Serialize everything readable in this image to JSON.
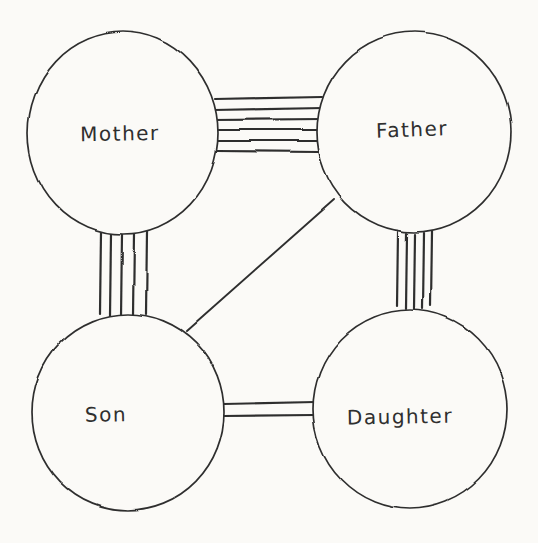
{
  "canvas": {
    "width": 538,
    "height": 543,
    "paper_color": "#fbfaf7",
    "ink_color": "#2f2f2f"
  },
  "diagram": {
    "nodes": [
      {
        "id": "mother",
        "label": "Mother",
        "cx": 123,
        "cy": 133,
        "rx": 95,
        "ry": 101,
        "label_dx": -3,
        "label_dy": 2,
        "label_tilt": -1
      },
      {
        "id": "father",
        "label": "Father",
        "cx": 414,
        "cy": 132,
        "rx": 97,
        "ry": 100,
        "label_dx": -2,
        "label_dy": -1,
        "label_tilt": -2
      },
      {
        "id": "son",
        "label": "Son",
        "cx": 128,
        "cy": 412,
        "rx": 96,
        "ry": 98,
        "label_dx": -22,
        "label_dy": 4,
        "label_tilt": -1
      },
      {
        "id": "daughter",
        "label": "Daughter",
        "cx": 410,
        "cy": 409,
        "rx": 97,
        "ry": 99,
        "label_dx": -10,
        "label_dy": 9,
        "label_tilt": -1
      }
    ],
    "edges": [
      {
        "id": "mother-father",
        "from": "mother",
        "to": "father",
        "line_count": 6,
        "stroke_width": 2.2,
        "segments": [
          [
            215,
            99,
            322,
            97
          ],
          [
            214,
            110,
            323,
            108
          ],
          [
            213,
            120,
            322,
            119
          ],
          [
            213,
            130,
            321,
            130
          ],
          [
            214,
            141,
            320,
            141
          ],
          [
            217,
            151,
            319,
            152
          ]
        ]
      },
      {
        "id": "mother-son",
        "from": "mother",
        "to": "son",
        "line_count": 5,
        "stroke_width": 2.2,
        "segments": [
          [
            101,
            231,
            100,
            313
          ],
          [
            111,
            233,
            110,
            316
          ],
          [
            122,
            234,
            121,
            317
          ],
          [
            134,
            233,
            133,
            316
          ],
          [
            147,
            231,
            146,
            314
          ]
        ]
      },
      {
        "id": "father-daughter",
        "from": "father",
        "to": "daughter",
        "line_count": 5,
        "stroke_width": 2.2,
        "segments": [
          [
            398,
            232,
            397,
            306
          ],
          [
            407,
            233,
            406,
            309
          ],
          [
            415,
            234,
            414,
            310
          ],
          [
            424,
            233,
            423,
            309
          ],
          [
            432,
            231,
            431,
            306
          ]
        ]
      },
      {
        "id": "son-daughter",
        "from": "son",
        "to": "daughter",
        "line_count": 2,
        "stroke_width": 2.2,
        "segments": [
          [
            224,
            404,
            315,
            402
          ],
          [
            224,
            416,
            314,
            415
          ]
        ]
      },
      {
        "id": "father-son",
        "from": "father",
        "to": "son",
        "line_count": 1,
        "stroke_width": 1.9,
        "segments": [
          [
            334,
            200,
            186,
            331
          ]
        ]
      }
    ]
  }
}
